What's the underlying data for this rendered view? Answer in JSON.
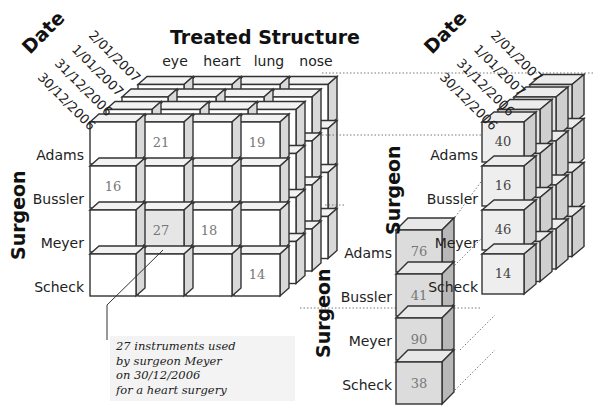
{
  "figure": {
    "left_cube": {
      "title": "Treated Structure",
      "date_axis_label": "Date",
      "surgeon_axis_label": "Surgeon",
      "dates": [
        "2/01/2007",
        "1/01/2007",
        "31/12/2006",
        "30/12/2006"
      ],
      "structures": [
        "eye",
        "heart",
        "lung",
        "nose"
      ],
      "surgeons": [
        "Adams",
        "Bussler",
        "Meyer",
        "Scheck"
      ],
      "front_face_values": [
        [
          "",
          "21",
          "",
          "19"
        ],
        [
          "16",
          "",
          "",
          ""
        ],
        [
          "",
          "27",
          "18",
          ""
        ],
        [
          "",
          "",
          "",
          "14"
        ]
      ],
      "highlighted_cell": {
        "surgeon": "Meyer",
        "structure": "heart",
        "value": "27"
      }
    },
    "annotation": {
      "lines": [
        "27 instruments used",
        "by surgeon Meyer",
        "on 30/12/2006",
        "for a heart surgery"
      ]
    },
    "right_cube": {
      "date_axis_label": "Date",
      "surgeon_axis_label": "Surgeon",
      "dates": [
        "2/01/2007",
        "1/01/2007",
        "31/12/2006",
        "30/12/2006"
      ],
      "surgeons": [
        "Adams",
        "Bussler",
        "Meyer",
        "Scheck"
      ],
      "front_column_values": [
        "40",
        "16",
        "46",
        "14"
      ]
    },
    "rolled_up_column": {
      "surgeon_axis_label": "Surgeon",
      "surgeons": [
        "Adams",
        "Bussler",
        "Meyer",
        "Scheck"
      ],
      "values": [
        "76",
        "41",
        "90",
        "38"
      ]
    },
    "colors": {
      "cube_face": "#ffffff",
      "cube_side": "#d9d9d9",
      "cube_top": "#f2f2f2",
      "shaded_face": "#e6e6e6",
      "column_face": "#dcdcdc",
      "edge": "#333333",
      "note_bg": "#f3f3f3"
    }
  }
}
